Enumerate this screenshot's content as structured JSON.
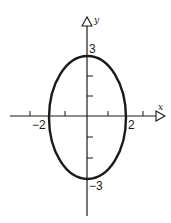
{
  "figure": {
    "type": "ellipse-on-axes",
    "colors": {
      "stroke": "#1a1a1a",
      "background": "#ffffff"
    },
    "axes": {
      "x_label": "x",
      "y_label": "y"
    },
    "labels": {
      "x_neg": "−2",
      "x_pos": "2",
      "y_pos": "3",
      "y_neg": "−3"
    },
    "ellipse": {
      "semi_axis_x": 2,
      "semi_axis_y": 3,
      "equation": "x^2/4 + y^2/9 = 1"
    },
    "ticks": {
      "x": [
        -3,
        -1,
        1,
        3
      ],
      "y": [
        -2,
        -1,
        1,
        2
      ]
    }
  }
}
